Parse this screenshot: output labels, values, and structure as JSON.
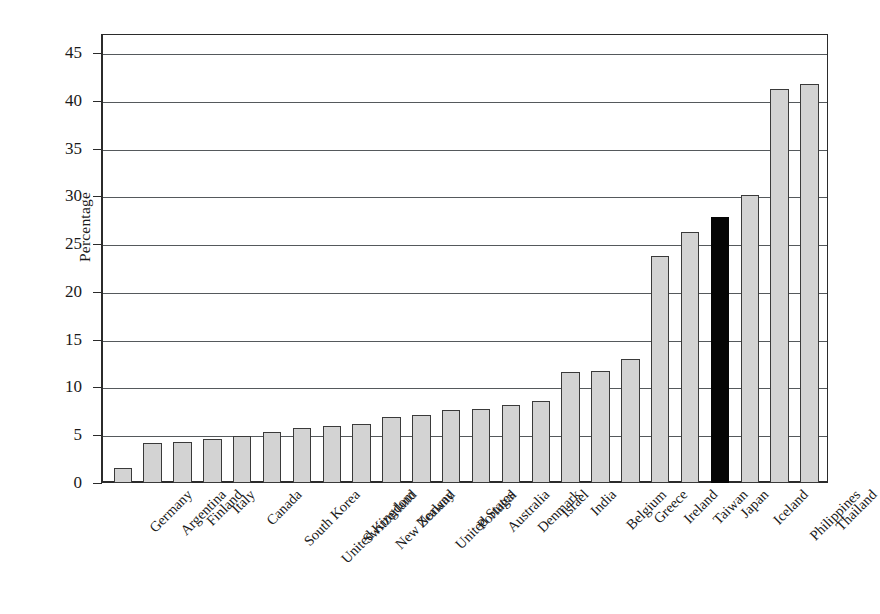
{
  "chart_data": {
    "type": "bar",
    "title": "",
    "xlabel": "",
    "ylabel": "Percentage",
    "ylim": [
      0,
      47
    ],
    "y_ticks": [
      0,
      5,
      10,
      15,
      20,
      25,
      30,
      35,
      40,
      45
    ],
    "grid": true,
    "legend": "none",
    "categories": [
      "Germany",
      "Argentina",
      "Finland",
      "Italy",
      "Canada",
      "South Korea",
      "United Kingdom",
      "Switzerland",
      "New Zealand",
      "Norway",
      "United States",
      "Portugal",
      "Australia",
      "Denmark",
      "Israel",
      "India",
      "Belgium",
      "Greece",
      "Ireland",
      "Taiwan",
      "Japan",
      "Iceland",
      "Philippines",
      "Thailand"
    ],
    "values": [
      1.6,
      4.2,
      4.3,
      4.6,
      4.9,
      5.3,
      5.8,
      6.0,
      6.2,
      6.9,
      7.1,
      7.6,
      7.7,
      8.2,
      8.6,
      11.6,
      11.7,
      13.0,
      23.8,
      26.3,
      27.8,
      30.2,
      41.2,
      41.8
    ],
    "highlight_category": "Japan",
    "colors": {
      "bar_fill": "#d3d3d3",
      "bar_border": "#3a3a3a",
      "highlight_fill": "#050505",
      "axis": "#2b2b2b",
      "gridline": "#55595c",
      "background": "#ffffff"
    }
  }
}
